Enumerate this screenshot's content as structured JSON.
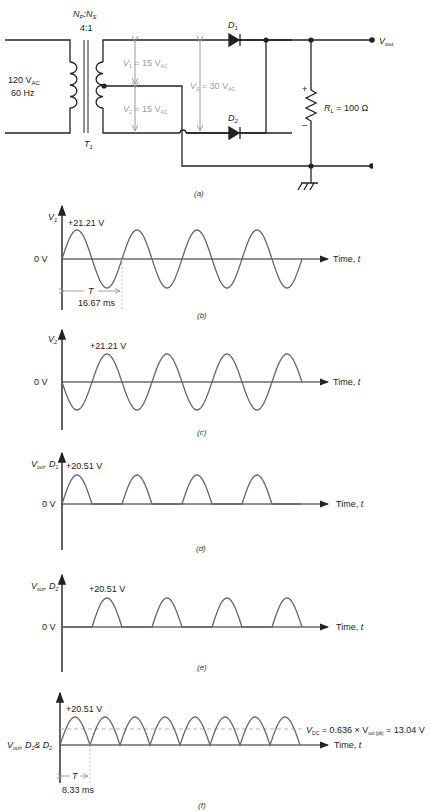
{
  "figure": {
    "panels": [
      "(a)",
      "(b)",
      "(c)",
      "(d)",
      "(e)",
      "(f)"
    ]
  },
  "circuit": {
    "source": {
      "voltage": "120 V",
      "voltage_sub": "AC",
      "frequency": "60 Hz"
    },
    "transformer": {
      "ratio_label_np": "N",
      "ratio_label_np_sub": "P",
      "ratio_label_ns": "N",
      "ratio_label_ns_sub": "S",
      "ratio": "4:1",
      "name": "T",
      "name_sub": "1"
    },
    "v1": {
      "label": "V",
      "sub": "1",
      "value": " = 15 V",
      "value_sub": "AC"
    },
    "v2": {
      "label": "V",
      "sub": "2",
      "value": " = 15 V",
      "value_sub": "AC"
    },
    "vs": {
      "label": "V",
      "sub": "S",
      "value": " = 30 V",
      "value_sub": "AC"
    },
    "d1": {
      "label": "D",
      "sub": "1"
    },
    "d2": {
      "label": "D",
      "sub": "2"
    },
    "load": {
      "label": "R",
      "sub": "L",
      "value": " = 100 Ω",
      "plus": "+",
      "minus": "–"
    },
    "output": {
      "label": "V",
      "sub": "out"
    },
    "caption": "(a)"
  },
  "chart_data": [
    {
      "type": "line",
      "panel": "(b)",
      "ylabel": "V1",
      "xlabel": "Time, t",
      "zero_label": "0 V",
      "peak_label": "+21.21 V",
      "period_label": "T",
      "period_value": "16.67 ms",
      "waveform": "sine",
      "peak": 21.21,
      "cycles": 4,
      "phase": "starts positive",
      "caption": "(b)"
    },
    {
      "type": "line",
      "panel": "(c)",
      "ylabel": "V2",
      "xlabel": "Time, t",
      "zero_label": "0 V",
      "peak_label": "+21.21 V",
      "waveform": "sine (inverted, 180° out of phase with V1)",
      "peak": 21.21,
      "cycles": 4,
      "caption": "(c)"
    },
    {
      "type": "line",
      "panel": "(d)",
      "ylabel": "Vout, D1",
      "xlabel": "Time, t",
      "zero_label": "0 V",
      "peak_label": "+20.51 V",
      "waveform": "half-wave rectified (first half-cycles)",
      "peak": 20.51,
      "pulses": 4,
      "caption": "(d)"
    },
    {
      "type": "line",
      "panel": "(e)",
      "ylabel": "Vout, D2",
      "xlabel": "Time, t",
      "zero_label": "0 V",
      "peak_label": "+20.51 V",
      "waveform": "half-wave rectified (second half-cycles)",
      "peak": 20.51,
      "pulses": 4,
      "caption": "(e)"
    },
    {
      "type": "line",
      "panel": "(f)",
      "ylabel": "Vout, D1 & D2",
      "xlabel": "Time, t",
      "peak_label": "+20.51 V",
      "period_label": "T",
      "period_value": "8.33 ms",
      "waveform": "full-wave rectified",
      "peak": 20.51,
      "pulses": 8,
      "dc_level": 13.04,
      "dc_label": "V_DC = 0.636 × V_out(pk) = 13.04 V",
      "caption": "(f)"
    }
  ],
  "labels": {
    "time_axis": "Time, ",
    "time_var": "t",
    "zero": "0 V",
    "peak_sine": "+21.21 V",
    "peak_rect": "+20.51 V",
    "period_b": "16.67 ms",
    "period_f": "8.33 ms",
    "period_sym": "T",
    "vdc_prefix": "V",
    "vdc_sub": "DC",
    "vdc_mid": " = 0.636 × V",
    "vdc_sub2": "out (pk)",
    "vdc_end": " = 13.04 V",
    "ylabel_b": "V",
    "ylabel_b_sub": "1",
    "ylabel_c": "V",
    "ylabel_c_sub": "2",
    "ylabel_d": "V",
    "ylabel_d_sub": "out",
    "ylabel_d_tail": ", D",
    "ylabel_d_tail_sub": "1",
    "ylabel_e_tail_sub": "2",
    "ylabel_f_mid": ", D",
    "ylabel_f_sub1": "1",
    "ylabel_f_amp": "& D",
    "ylabel_f_sub2": "2"
  },
  "colors": {
    "line": "#222222",
    "wave": "#666666",
    "dim": "#9a9a9a"
  }
}
